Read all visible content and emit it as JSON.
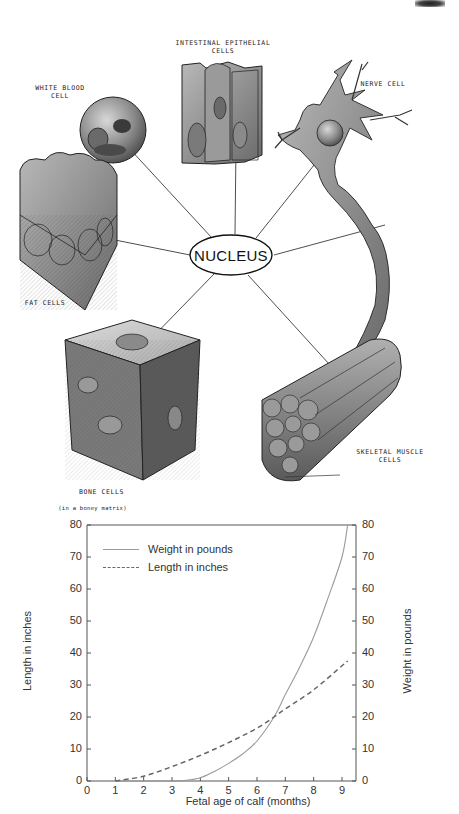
{
  "diagram": {
    "center_label": "NUCLEUS",
    "cells": [
      {
        "id": "white-blood-cell",
        "label": "WHITE BLOOD\nCELL"
      },
      {
        "id": "intestinal-epithelial-cells",
        "label": "INTESTINAL EPITHELIAL\nCELLS"
      },
      {
        "id": "nerve-cell",
        "label": "NERVE CELL"
      },
      {
        "id": "fat-cells",
        "label": "FAT CELLS"
      },
      {
        "id": "bone-cells",
        "label": "BONE CELLS",
        "sublabel": "(in a boney matrix)"
      },
      {
        "id": "skeletal-muscle-cells",
        "label": "SKELETAL MUSCLE\nCELLS"
      }
    ]
  },
  "chart": {
    "legend": {
      "weight": "Weight in pounds",
      "length": "Length in inches"
    },
    "xlabel": "Fetal age of calf (months)",
    "ylabel_left": "Length in inches",
    "ylabel_right": "Weight in pounds",
    "x_ticks": [
      "0",
      "1",
      "2",
      "3",
      "4",
      "5",
      "6",
      "7",
      "8",
      "9"
    ],
    "y_ticks": [
      "0",
      "10",
      "20",
      "30",
      "40",
      "50",
      "60",
      "70",
      "80"
    ],
    "colors": {
      "weight_line": "#9a9a9a",
      "length_line": "#666666",
      "axis": "#555555"
    }
  },
  "chart_data": {
    "type": "line",
    "title": "",
    "xlabel": "Fetal age of calf (months)",
    "ylabel": "Length in inches",
    "ylabel_secondary": "Weight in pounds",
    "xlim": [
      0,
      9.5
    ],
    "ylim": [
      0,
      80
    ],
    "ylim_secondary": [
      0,
      80
    ],
    "x_ticks": [
      0,
      1,
      2,
      3,
      4,
      5,
      6,
      7,
      8,
      9
    ],
    "y_ticks": [
      0,
      10,
      20,
      30,
      40,
      50,
      60,
      70,
      80
    ],
    "grid": false,
    "legend_position": "upper left",
    "series": [
      {
        "name": "Weight in pounds",
        "style": "solid",
        "axis": "right",
        "x": [
          1,
          2,
          3,
          3.5,
          4,
          4.5,
          5,
          5.5,
          6,
          6.6,
          7,
          7.5,
          8,
          8.5,
          9,
          9.2
        ],
        "values": [
          0,
          0,
          0,
          0.2,
          1,
          3,
          5.5,
          8.5,
          12.5,
          20,
          27,
          35.5,
          45,
          57,
          70,
          80
        ]
      },
      {
        "name": "Length in inches",
        "style": "dashed",
        "axis": "left",
        "x": [
          1,
          2,
          3,
          4,
          5,
          6,
          6.6,
          7,
          8,
          9,
          9.2
        ],
        "values": [
          0,
          1.5,
          4.5,
          8,
          12,
          16.5,
          20,
          22.5,
          28.5,
          36,
          37.5
        ]
      }
    ]
  }
}
